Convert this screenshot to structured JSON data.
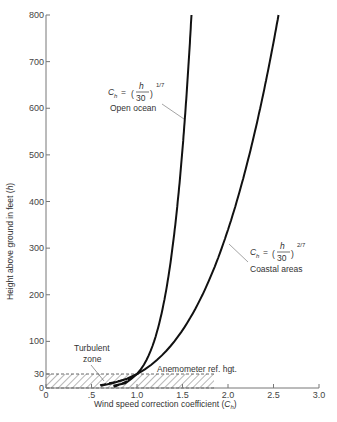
{
  "chart_data": {
    "type": "line",
    "title": "",
    "xlabel": "Wind speed correction coefficient (C_h)",
    "xlabel_main": "Wind speed correction coefficient (",
    "xlabel_symbol": "C",
    "xlabel_sub": "h",
    "xlabel_close": ")",
    "ylabel": "Height above ground in feet (h)",
    "ylabel_main": "Height above ground in feet (",
    "ylabel_symbol": "h",
    "ylabel_close": ")",
    "xlim": [
      0,
      3.0
    ],
    "ylim": [
      0,
      800
    ],
    "grid": false,
    "x_ticks": [
      {
        "value": 0,
        "label": "0"
      },
      {
        "value": 0.5,
        "label": ".5"
      },
      {
        "value": 1.0,
        "label": "1.0"
      },
      {
        "value": 1.5,
        "label": "1.5"
      },
      {
        "value": 2.0,
        "label": "2.0"
      },
      {
        "value": 2.5,
        "label": "2.5"
      },
      {
        "value": 3.0,
        "label": "3.0"
      }
    ],
    "y_ticks": [
      {
        "value": 0,
        "label": "0"
      },
      {
        "value": 30,
        "label": "30"
      },
      {
        "value": 100,
        "label": "100"
      },
      {
        "value": 200,
        "label": "200"
      },
      {
        "value": 300,
        "label": "300"
      },
      {
        "value": 400,
        "label": "400"
      },
      {
        "value": 500,
        "label": "500"
      },
      {
        "value": 600,
        "label": "600"
      },
      {
        "value": 700,
        "label": "700"
      },
      {
        "value": 800,
        "label": "800"
      }
    ],
    "series": [
      {
        "name": "Open ocean",
        "formula": "C_h = (h/30)^(1/7)",
        "exponent": "1/7",
        "points": [
          [
            0.74,
            5
          ],
          [
            0.87,
            10
          ],
          [
            0.94,
            20
          ],
          [
            1.0,
            30
          ],
          [
            1.17,
            90
          ],
          [
            1.22,
            120
          ],
          [
            1.3,
            190
          ],
          [
            1.36,
            260
          ],
          [
            1.41,
            330
          ],
          [
            1.46,
            420
          ],
          [
            1.5,
            500
          ],
          [
            1.54,
            600
          ],
          [
            1.57,
            700
          ],
          [
            1.6,
            800
          ]
        ]
      },
      {
        "name": "Coastal areas",
        "formula": "C_h = (h/30)^(2/7)",
        "exponent": "2/7",
        "points": [
          [
            0.6,
            5
          ],
          [
            0.73,
            10
          ],
          [
            0.89,
            20
          ],
          [
            1.0,
            30
          ],
          [
            1.31,
            77
          ],
          [
            1.52,
            130
          ],
          [
            1.73,
            200
          ],
          [
            1.93,
            290
          ],
          [
            2.1,
            385
          ],
          [
            2.22,
            460
          ],
          [
            2.33,
            540
          ],
          [
            2.44,
            650
          ],
          [
            2.52,
            740
          ],
          [
            2.56,
            800
          ]
        ]
      }
    ],
    "annotations": [
      {
        "text": "Open ocean",
        "formula_lhs": "C",
        "formula_sub": "h",
        "formula_eq": "=",
        "formula_num": "h",
        "formula_den": "30",
        "formula_exp": "1/7"
      },
      {
        "text": "Coastal areas",
        "formula_lhs": "C",
        "formula_sub": "h",
        "formula_eq": "=",
        "formula_num": "h",
        "formula_den": "30",
        "formula_exp": "2/7"
      },
      {
        "text_line1": "Turbulent",
        "text_line2": "zone"
      },
      {
        "text": "Anemometer ref. hgt.",
        "region": {
          "x": [
            0,
            1.85
          ],
          "y": [
            0,
            30
          ],
          "fill": "hatched"
        }
      }
    ]
  }
}
